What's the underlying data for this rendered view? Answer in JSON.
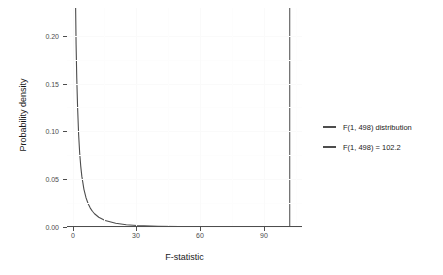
{
  "chart_data": {
    "type": "line",
    "title": "",
    "xlabel": "F-statistic",
    "ylabel": "Probability density",
    "xlim": [
      -3,
      108
    ],
    "ylim": [
      0,
      0.2295
    ],
    "xticks": [
      0,
      30,
      60,
      90
    ],
    "xticklabels": [
      "0",
      "30",
      "60",
      "90"
    ],
    "yticks": [
      0.0,
      0.05,
      0.1,
      0.15,
      0.2
    ],
    "yticklabels": [
      "0.00",
      "0.05",
      "0.10",
      "0.15",
      "0.20"
    ],
    "grid": true,
    "legend_position": "right",
    "series": [
      {
        "name": "F(1, 498) distribution",
        "type": "line",
        "color": "#4d4d4d",
        "x": [
          0.2,
          0.4,
          0.6,
          0.8,
          1.0,
          1.3,
          1.6,
          2.0,
          2.5,
          3.0,
          3.5,
          4.0,
          5.0,
          6.0,
          7.0,
          8.0,
          9.0,
          10.0,
          12.0,
          15.0,
          20.0,
          25.0,
          30.0,
          40.0,
          50.0,
          60.0,
          70.0,
          80.0,
          90.0,
          100.0,
          105.0
        ],
        "y": [
          0.772,
          0.4932,
          0.3681,
          0.2931,
          0.242,
          0.1909,
          0.157,
          0.1255,
          0.0966,
          0.0773,
          0.0635,
          0.0533,
          0.0395,
          0.0305,
          0.0243,
          0.0198,
          0.0165,
          0.0139,
          0.0102,
          0.0068,
          0.0039,
          0.0024,
          0.0016,
          0.00076,
          0.00041,
          0.00024,
          0.00016,
          0.00011,
          7e-05,
          5e-05,
          4e-05
        ]
      },
      {
        "name": "F(1, 498) = 102.2",
        "type": "vline",
        "color": "#595959",
        "x": 102.2
      }
    ],
    "legend": [
      {
        "label": "F(1, 498) distribution",
        "color": "#4d4d4d"
      },
      {
        "label": "F(1, 498) = 102.2",
        "color": "#4d4d4d"
      }
    ],
    "annotations": []
  },
  "axes": {
    "x_title": "F-statistic",
    "y_title": "Probability density"
  },
  "colors": {
    "curve": "#4d4d4d",
    "vline": "#595959",
    "axis": "#4d4d4d",
    "text": "#1a1a1a",
    "grid": "#fafafa",
    "background": "#ffffff"
  }
}
